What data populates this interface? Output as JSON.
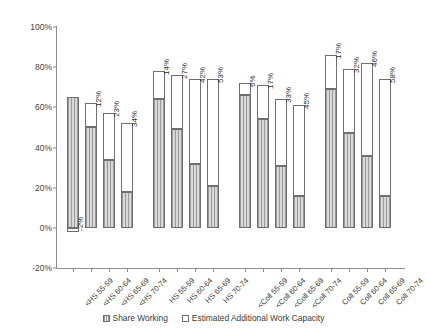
{
  "chart_data": {
    "type": "bar",
    "title": "",
    "subtitle": "",
    "xlabel": "",
    "ylabel": "",
    "ylim": [
      -20,
      100
    ],
    "ytick_labels": [
      "100%",
      "80%",
      "60%",
      "40%",
      "20%",
      "0%",
      "-20%"
    ],
    "ytick_values": [
      100,
      80,
      60,
      40,
      20,
      0,
      -20
    ],
    "grid": false,
    "stacked": true,
    "legend_position": "bottom",
    "categories": [
      "<HS 55-59",
      "<HS 60-64",
      "<HS 65-69",
      "<HS 70-74",
      "HS 55-59",
      "HS 60-64",
      "HS 65-69",
      "HS 70-74",
      "<Coll 55-59",
      "<Coll 60-64",
      "<Coll 65-69",
      "<Coll 70-74",
      "Coll 55-59",
      "Coll 60-64",
      "Coll 65-69",
      "Coll 70-74"
    ],
    "groups": [
      "<HS",
      "HS",
      "<Coll",
      "Coll"
    ],
    "series": [
      {
        "name": "Share Working",
        "values": [
          65,
          50,
          34,
          18,
          64,
          49,
          32,
          21,
          66,
          54,
          31,
          16,
          69,
          47,
          36,
          16
        ]
      },
      {
        "name": "Estimated Additional Work Capacity",
        "values": [
          -2,
          12,
          23,
          34,
          14,
          27,
          42,
          53,
          6,
          17,
          33,
          45,
          17,
          32,
          46,
          58
        ]
      }
    ],
    "data_labels": [
      "-2%",
      "12%",
      "23%",
      "34%",
      "14%",
      "27%",
      "42%",
      "53%",
      "6%",
      "17%",
      "33%",
      "45%",
      "17%",
      "32%",
      "46%",
      "58%"
    ]
  },
  "legend": {
    "items": [
      {
        "label": "Share Working",
        "swatch": "hatched-gray"
      },
      {
        "label": "Estimated Additional Work Capacity",
        "swatch": "open-white"
      }
    ]
  },
  "colors": {
    "share_working": "#9b9b9b",
    "additional_capacity": "#ffffff",
    "bar_border": "#6f6f6f",
    "axis": "#8d8d8d",
    "text": "#3b3b3b"
  }
}
